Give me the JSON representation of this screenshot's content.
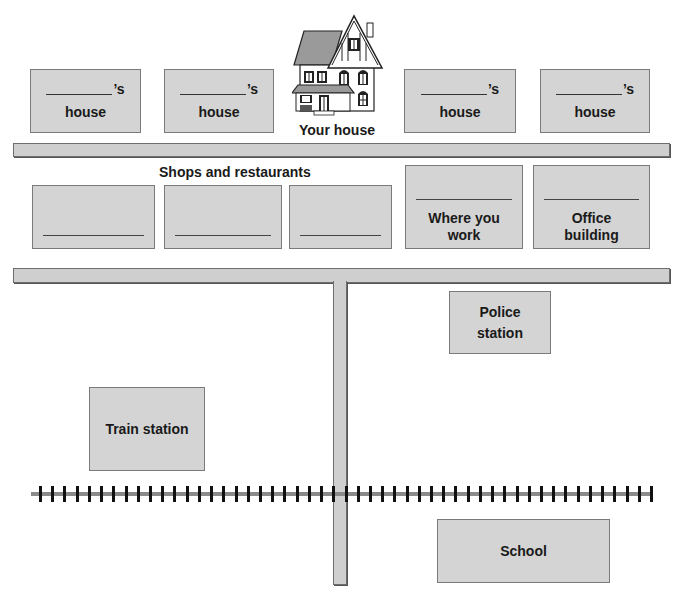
{
  "title_fragment": "",
  "your_house": {
    "label": "Your house",
    "icon": "house-illustration"
  },
  "neighbor_houses": [
    {
      "blank": "",
      "possessive": "’s",
      "label": "house"
    },
    {
      "blank": "",
      "possessive": "’s",
      "label": "house"
    },
    {
      "blank": "",
      "possessive": "’s",
      "label": "house"
    },
    {
      "blank": "",
      "possessive": "’s",
      "label": "house"
    }
  ],
  "shops_heading": "Shops and restaurants",
  "shops": [
    {
      "blank": ""
    },
    {
      "blank": ""
    },
    {
      "blank": ""
    }
  ],
  "work": {
    "blank": "",
    "label": "Where you work"
  },
  "office": {
    "blank": "",
    "label": "Office building"
  },
  "police": {
    "label": "Police station"
  },
  "train": {
    "label": "Train station"
  },
  "school": {
    "label": "School"
  },
  "railway": {
    "tie_count": 51
  },
  "colors": {
    "box_fill": "#d4d4d4",
    "box_border": "#7a7a7a",
    "road_fill": "#cfcfcf",
    "rail": "#8a8a8a",
    "tie": "#111111"
  }
}
